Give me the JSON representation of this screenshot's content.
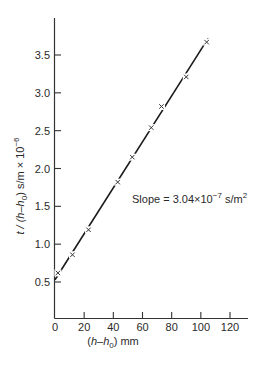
{
  "chart_data": {
    "type": "scatter",
    "title": "",
    "xlabel": "(h−h0) mm",
    "ylabel": "t / (h−h0) s/m × 10^-6",
    "xlim": [
      0,
      130
    ],
    "ylim": [
      0,
      3.9
    ],
    "x_ticks": [
      0,
      20,
      40,
      60,
      80,
      100,
      120
    ],
    "y_ticks": [
      0.5,
      1.0,
      1.5,
      2.0,
      2.5,
      3.0,
      3.5
    ],
    "grid": false,
    "legend": null,
    "series": [
      {
        "name": "measurements",
        "marker": "x",
        "x": [
          2,
          12,
          23,
          43,
          53,
          66,
          73,
          90,
          104
        ],
        "y": [
          0.62,
          0.86,
          1.19,
          1.82,
          2.15,
          2.54,
          2.82,
          3.21,
          3.67
        ]
      },
      {
        "name": "fit line",
        "style": "solid",
        "x": [
          0,
          105
        ],
        "y": [
          0.53,
          3.72
        ]
      }
    ],
    "annotations": [
      {
        "text": "Slope = 3.04×10^-7 s/m^2",
        "x": 72,
        "y": 1.6
      }
    ]
  },
  "labels": {
    "x_axis_prefix": "(",
    "x_axis_h": "h",
    "x_axis_dash": "–",
    "x_axis_h0": "h",
    "x_axis_sub0": "0",
    "x_axis_suffix": ") mm",
    "y_axis_main": "t / (h–h",
    "y_axis_sub0": "0",
    "y_axis_rest": ") s/m × 10",
    "y_axis_exp": "−6",
    "slope_main": "Slope = 3.04×10",
    "slope_exp": "−7",
    "slope_unit": " s/m",
    "slope_unit_exp": "2"
  },
  "tick_labels": {
    "x": [
      "0",
      "20",
      "40",
      "60",
      "80",
      "100",
      "120"
    ],
    "y": [
      "0.5",
      "1.0",
      "1.5",
      "2.0",
      "2.5",
      "3.0",
      "3.5"
    ]
  }
}
